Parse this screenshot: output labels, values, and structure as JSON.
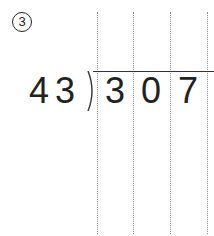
{
  "problem": {
    "number_label": "3",
    "divisor": "43",
    "dividend_digits": [
      "3",
      "0",
      "7"
    ]
  },
  "grid": {
    "column_lines_x": [
      97,
      133,
      170,
      207
    ]
  }
}
